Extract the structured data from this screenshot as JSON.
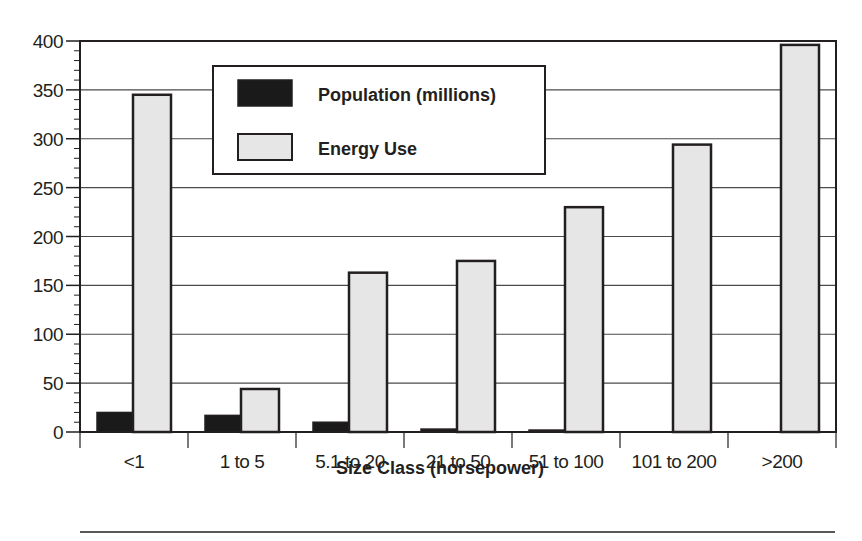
{
  "chart_data": {
    "type": "bar",
    "title": "",
    "xlabel": "Size Class (horsepower)",
    "ylabel": "",
    "categories": [
      "<1",
      "1 to 5",
      "5.1 to 20",
      "21 to 50",
      "51 to 100",
      "101 to 200",
      ">200"
    ],
    "series": [
      {
        "name": "Population (millions)",
        "color": "#1a1a1a",
        "values": [
          20,
          17,
          10,
          3,
          2,
          0,
          0
        ]
      },
      {
        "name": "Energy Use",
        "color": "#e6e6e6",
        "values": [
          345,
          44,
          163,
          175,
          230,
          294,
          396
        ]
      }
    ],
    "ylim": [
      0,
      400
    ],
    "yticks": [
      0,
      50,
      100,
      150,
      200,
      250,
      300,
      350,
      400
    ],
    "minor_tick_step": 10,
    "grid": true,
    "legend_position": "upper-left-inside"
  },
  "colors": {
    "axis": "#231f20",
    "grid": "#4a4a4a",
    "bar_outline": "#231f20"
  }
}
